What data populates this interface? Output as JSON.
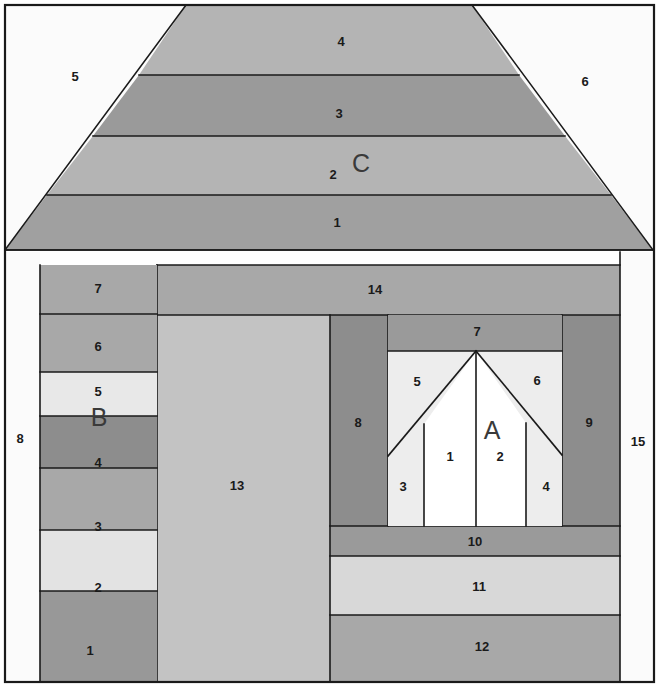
{
  "diagram": {
    "canvas": {
      "width": 659,
      "height": 687
    },
    "background_color": "#ffffff",
    "line_color": "#1a1a1a"
  },
  "palette": {
    "white": "#ffffff",
    "off_white": "#fbfbfb",
    "very_light_gray": "#e8e8e8",
    "light_gray": "#d2d2d2",
    "mid_light_gray": "#c3c3c3",
    "mid_gray": "#b4b4b4",
    "gray": "#a8a8a8",
    "dark_gray": "#9a9a9a",
    "darker_gray": "#8d8d8d"
  },
  "blocks": [
    {
      "id": "A",
      "name": "window-block",
      "label": "A",
      "label_x": 492,
      "label_y": 432
    },
    {
      "id": "B",
      "name": "chimney-stack-block",
      "label": "B",
      "label_x": 99,
      "label_y": 419
    },
    {
      "id": "C",
      "name": "roof-block",
      "label": "C",
      "label_x": 361,
      "label_y": 165
    }
  ],
  "roof": {
    "name": "roof-section",
    "pieces": [
      {
        "num": "4",
        "label_x": 341,
        "label_y": 43,
        "fill": "#b4b4b4"
      },
      {
        "num": "3",
        "label_x": 339,
        "label_y": 115,
        "fill": "#9a9a9a"
      },
      {
        "num": "2",
        "label_x": 333,
        "label_y": 175,
        "fill": "#b4b4b4"
      },
      {
        "num": "1",
        "label_x": 337,
        "label_y": 224,
        "fill": "#a0a0a0"
      },
      {
        "num": "5",
        "label_x": 75,
        "label_y": 78,
        "fill": "#fbfbfb"
      },
      {
        "num": "6",
        "label_x": 585,
        "label_y": 83,
        "fill": "#fbfbfb"
      }
    ]
  },
  "chimney_stack": {
    "name": "chimney-stack-section",
    "pieces": [
      {
        "num": "7",
        "label_x": 98,
        "label_y": 290,
        "fill": "#a8a8a8"
      },
      {
        "num": "6",
        "label_x": 98,
        "label_y": 348,
        "fill": "#a8a8a8"
      },
      {
        "num": "5",
        "label_x": 98,
        "label_y": 393,
        "fill": "#e8e8e8"
      },
      {
        "num": "4",
        "label_x": 98,
        "label_y": 464,
        "fill": "#8d8d8d"
      },
      {
        "num": "3",
        "label_x": 98,
        "label_y": 528,
        "fill": "#a8a8a8"
      },
      {
        "num": "2",
        "label_x": 98,
        "label_y": 589,
        "fill": "#e3e3e3"
      },
      {
        "num": "1",
        "label_x": 90,
        "label_y": 652,
        "fill": "#989898"
      },
      {
        "num": "8",
        "label_x": 20,
        "label_y": 440,
        "fill": "#fbfbfb"
      }
    ]
  },
  "house_body": {
    "name": "house-body-section",
    "pieces": [
      {
        "num": "14",
        "label_x": 375,
        "label_y": 291,
        "fill": "#a8a8a8"
      },
      {
        "num": "13",
        "label_x": 237,
        "label_y": 487,
        "fill": "#c3c3c3"
      },
      {
        "num": "8",
        "label_x": 358,
        "label_y": 424,
        "fill": "#8d8d8d"
      },
      {
        "num": "9",
        "label_x": 589,
        "label_y": 424,
        "fill": "#8d8d8d"
      },
      {
        "num": "10",
        "label_x": 475,
        "label_y": 543,
        "fill": "#9a9a9a"
      },
      {
        "num": "11",
        "label_x": 479,
        "label_y": 588,
        "fill": "#d8d8d8"
      },
      {
        "num": "12",
        "label_x": 482,
        "label_y": 648,
        "fill": "#a8a8a8"
      },
      {
        "num": "15",
        "label_x": 638,
        "label_y": 443,
        "fill": "#fbfbfb"
      }
    ]
  },
  "window_block": {
    "name": "window-block-section",
    "pieces": [
      {
        "num": "7",
        "label_x": 477,
        "label_y": 333,
        "fill": "#9a9a9a"
      },
      {
        "num": "5",
        "label_x": 417,
        "label_y": 383,
        "fill": "#ededed"
      },
      {
        "num": "6",
        "label_x": 537,
        "label_y": 382,
        "fill": "#ededed"
      },
      {
        "num": "1",
        "label_x": 450,
        "label_y": 457,
        "fill": "#ffffff"
      },
      {
        "num": "2",
        "label_x": 500,
        "label_y": 457,
        "fill": "#ffffff"
      },
      {
        "num": "3",
        "label_x": 403,
        "label_y": 488,
        "fill": "#ededed"
      },
      {
        "num": "4",
        "label_x": 546,
        "label_y": 488,
        "fill": "#ededed"
      }
    ]
  }
}
